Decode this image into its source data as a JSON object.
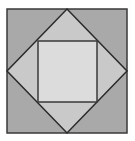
{
  "diagram": {
    "outer_square": {
      "x": 7,
      "y": 9,
      "width": 120,
      "height": 124,
      "fill": "#a9a9a9",
      "stroke": "#3a3a3a"
    },
    "diamond": {
      "points": "67,9 127,71 67,133 7,71",
      "fill": "#c9c9c9",
      "stroke": "#2a2a2a"
    },
    "inner_square": {
      "x": 38,
      "y": 41,
      "width": 59,
      "height": 61,
      "fill": "#dcdcdc",
      "stroke": "#3a3a3a"
    }
  }
}
